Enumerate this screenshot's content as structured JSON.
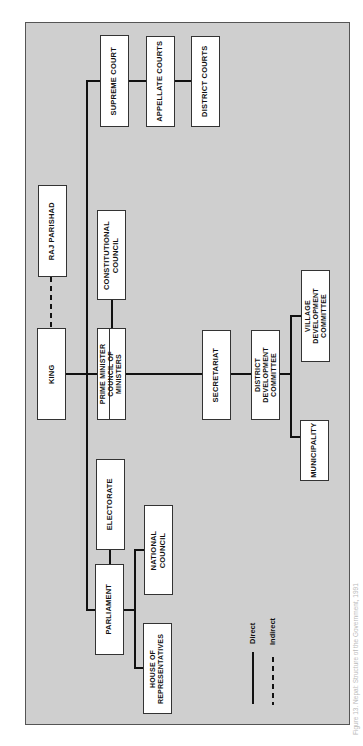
{
  "diagram": {
    "orientation": "rotated 90deg counter-clockwise",
    "background_color": "#cfcfcf",
    "nodes": {
      "king": "KING",
      "raj_parishad": "RAJ PARISHAD",
      "prime_minister": "PRIME MINISTER\nCOUNCIL OF\nMINISTERS",
      "constitutional_council": "CONSTITUTIONAL\nCOUNCIL",
      "supreme_court": "SUPREME COURT",
      "appellate_courts": "APPELLATE COURTS",
      "district_courts": "DISTRICT COURTS",
      "secretariat": "SECRETARIAT",
      "district_development_committee": "DISTRICT\nDEVELOPMENT\nCOMMITTEE",
      "village_development_committee": "VILLAGE\nDEVELOPMENT\nCOMMITTEE",
      "municipality": "MUNICIPALITY",
      "electorate": "ELECTORATE",
      "parliament": "PARLIAMENT",
      "national_council": "NATIONAL\nCOUNCIL",
      "house_of_representatives": "HOUSE OF\nREPRESENTATIVES"
    },
    "edges": [
      {
        "from": "KING",
        "to": "RAJ PARISHAD",
        "type": "indirect"
      },
      {
        "from": "KING",
        "to": "PRIME MINISTER COUNCIL OF MINISTERS",
        "type": "direct"
      },
      {
        "from": "KING",
        "to": "SUPREME COURT",
        "type": "direct"
      },
      {
        "from": "KING",
        "to": "PARLIAMENT",
        "type": "direct"
      },
      {
        "from": "PRIME MINISTER COUNCIL OF MINISTERS",
        "to": "CONSTITUTIONAL COUNCIL",
        "type": "direct"
      },
      {
        "from": "PRIME MINISTER COUNCIL OF MINISTERS",
        "to": "SECRETARIAT",
        "type": "direct"
      },
      {
        "from": "SECRETARIAT",
        "to": "DISTRICT DEVELOPMENT COMMITTEE",
        "type": "direct"
      },
      {
        "from": "DISTRICT DEVELOPMENT COMMITTEE",
        "to": "VILLAGE DEVELOPMENT COMMITTEE",
        "type": "direct"
      },
      {
        "from": "DISTRICT DEVELOPMENT COMMITTEE",
        "to": "MUNICIPALITY",
        "type": "direct"
      },
      {
        "from": "SUPREME COURT",
        "to": "APPELLATE COURTS",
        "type": "direct"
      },
      {
        "from": "APPELLATE COURTS",
        "to": "DISTRICT COURTS",
        "type": "direct"
      },
      {
        "from": "PARLIAMENT",
        "to": "ELECTORATE",
        "type": "direct"
      },
      {
        "from": "PARLIAMENT",
        "to": "NATIONAL COUNCIL",
        "type": "direct"
      },
      {
        "from": "PARLIAMENT",
        "to": "HOUSE OF REPRESENTATIVES",
        "type": "direct"
      }
    ],
    "legend": {
      "direct": "Direct",
      "indirect": "Indirect"
    },
    "caption": "Figure 13. Nepal: Structure of the Government, 1991"
  }
}
